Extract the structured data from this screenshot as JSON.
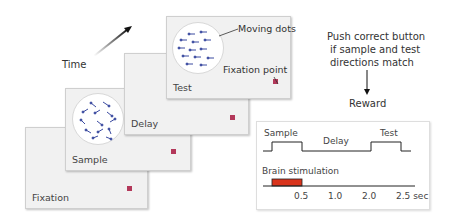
{
  "time_label": "Time",
  "panels": [
    {
      "id": "fixation",
      "label": "Fixation"
    },
    {
      "id": "sample",
      "label": "Sample"
    },
    {
      "id": "delay",
      "label": "Delay"
    },
    {
      "id": "test",
      "label": "Test"
    }
  ],
  "annotations": {
    "moving_dots": "Moving dots",
    "fixation_point": "Fixation point"
  },
  "instruction": {
    "line1": "Push correct button",
    "line2": "if sample and test",
    "line3": "directions match",
    "outcome": "Reward"
  },
  "timeline": {
    "sample_label": "Sample",
    "delay_label": "Delay",
    "test_label": "Test",
    "stim_label": "Brain stimulation",
    "ticks": [
      "0.5",
      "1.0",
      "2.0",
      "2.5 sec"
    ]
  },
  "colors": {
    "fixation_point": "#b3385a",
    "dots": "#3a4aa0",
    "stimulation": "#d9341c",
    "panel_bg": "#f1f1f1"
  }
}
